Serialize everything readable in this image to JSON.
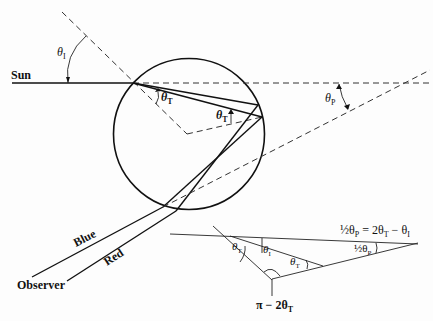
{
  "diagram": {
    "labels": {
      "sun": "Sun",
      "observer": "Observer",
      "blue": "Blue",
      "red": "Red",
      "theta_i_top": "θ",
      "theta_i_top_sub": "I",
      "theta_t_entry": "θ",
      "theta_t_entry_sub": "T",
      "theta_t_reflect": "θ",
      "theta_t_reflect_sub": "T",
      "theta_p": "θ",
      "theta_p_sub": "P"
    },
    "inset": {
      "equation_lhs": "½θ",
      "equation_lhs_sub": "P",
      "equation_rhs": " = 2θ",
      "equation_rhs_sub": "T",
      "equation_tail": " − θ",
      "equation_tail_sub": "I",
      "angle_theta_t_1": "θ",
      "angle_theta_t_1_sub": "T",
      "angle_theta_i": "θ",
      "angle_theta_i_sub": "I",
      "angle_theta_t_2": "θ",
      "angle_theta_t_2_sub": "T",
      "angle_half_theta_p": "½θ",
      "angle_half_theta_p_sub": "P",
      "vertex_label": "π − 2θ",
      "vertex_label_sub": "T"
    },
    "colors": {
      "ink": "#111111",
      "background": "#fdfdfd"
    }
  }
}
